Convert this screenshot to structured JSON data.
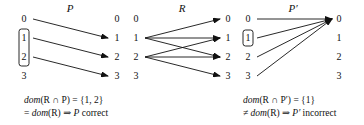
{
  "diagrams": [
    {
      "title": "P",
      "left": [
        "0",
        "1",
        "2",
        "3"
      ],
      "right": [
        "0",
        "1",
        "2",
        "3"
      ],
      "edges": [
        [
          0,
          1
        ],
        [
          1,
          2
        ],
        [
          2,
          3
        ]
      ],
      "highlighted_left": [
        1,
        2
      ]
    },
    {
      "title": "R",
      "left": [
        "0",
        "1",
        "2",
        "3"
      ],
      "right": [
        "0",
        "1",
        "2",
        "3"
      ],
      "edges": [
        [
          1,
          0
        ],
        [
          1,
          1
        ],
        [
          1,
          2
        ],
        [
          2,
          1
        ],
        [
          2,
          2
        ],
        [
          2,
          3
        ]
      ],
      "highlighted_left": []
    },
    {
      "title": "P′",
      "left": [
        "0",
        "1",
        "2",
        "3"
      ],
      "right": [
        "0",
        "1",
        "2",
        "3"
      ],
      "edges": [
        [
          0,
          0
        ],
        [
          1,
          0
        ],
        [
          2,
          0
        ],
        [
          3,
          0
        ]
      ],
      "highlighted_left": [
        1
      ]
    }
  ],
  "captions": {
    "left": {
      "line1_fn": "dom",
      "line1_rest": "(R ∩ P) = {1, 2}",
      "line2_prefix": "= ",
      "line2_fn": "dom",
      "line2_rest": "(R) ⇒ ",
      "line2_var": "P",
      "line2_verdict": " correct"
    },
    "right": {
      "line1_fn": "dom",
      "line1_rest": "(R ∩ P′) = {1}",
      "line2_prefix": "≠ ",
      "line2_fn": "dom",
      "line2_rest": "(R) ⇒ ",
      "line2_var": "P′",
      "line2_verdict": " incorrect"
    }
  }
}
